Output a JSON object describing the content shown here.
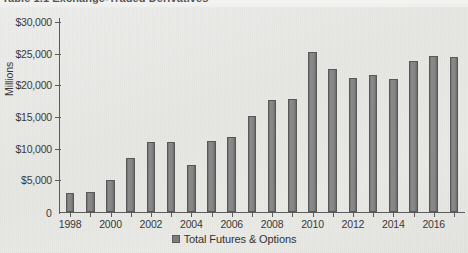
{
  "page": {
    "cut_off_heading": "Table 1.1 Exchange-Traded Derivatives"
  },
  "chart_data": {
    "type": "bar",
    "title": "",
    "xlabel": "",
    "ylabel": "Millions",
    "ylim": [
      0,
      30000
    ],
    "ytick_values": [
      0,
      5000,
      10000,
      15000,
      20000,
      25000,
      30000
    ],
    "ytick_labels": [
      "0",
      "$5,000",
      "$10,000",
      "$15,000",
      "$20,000",
      "$25,000",
      "$30,000"
    ],
    "grid": false,
    "legend_position": "bottom-center",
    "legend": [
      "Total Futures & Options"
    ],
    "series_name": "Total Futures & Options",
    "bar_color": "#7d7d7d",
    "bar_edge_color": "#585858",
    "categories": [
      "1998",
      "1999",
      "2000",
      "2001",
      "2002",
      "2003",
      "2004",
      "2005",
      "2006",
      "2007",
      "2008",
      "2009",
      "2010",
      "2011",
      "2012",
      "2013",
      "2014",
      "2015",
      "2016",
      "2017"
    ],
    "xtick_labels_shown": [
      "1998",
      "2000",
      "2002",
      "2004",
      "2006",
      "2008",
      "2010",
      "2012",
      "2014",
      "2016"
    ],
    "values": [
      3000,
      3100,
      5000,
      8500,
      11000,
      11100,
      7400,
      11200,
      11900,
      15200,
      17700,
      17800,
      25300,
      22600,
      21200,
      21700,
      21000,
      23900,
      24600,
      24500
    ]
  }
}
